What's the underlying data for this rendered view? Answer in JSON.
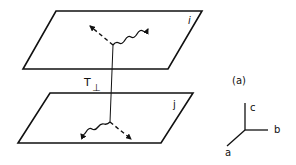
{
  "diagram": {
    "planes": [
      {
        "id": "plane-i",
        "label": "i"
      },
      {
        "id": "plane-j",
        "label": "j"
      }
    ],
    "coupling_label": "T",
    "coupling_subscript": "⊥",
    "panel_label": "(a)",
    "axes": {
      "c": "c",
      "b": "b",
      "a": "a"
    },
    "colors": {
      "line": "#111111",
      "background": "#ffffff"
    }
  }
}
